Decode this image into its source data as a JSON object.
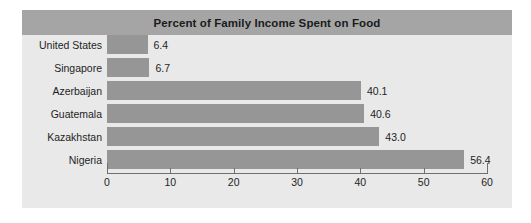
{
  "chart_data": {
    "type": "bar",
    "orientation": "horizontal",
    "title": "Percent of Family Income Spent on Food",
    "xlabel": "",
    "ylabel": "",
    "xlim": [
      0,
      60
    ],
    "xticks": [
      0,
      10,
      20,
      30,
      40,
      50,
      60
    ],
    "xtick_labels": [
      "0",
      "10",
      "20",
      "30",
      "40",
      "50",
      "60"
    ],
    "grid": false,
    "legend": "none",
    "categories": [
      "United States",
      "Singapore",
      "Azerbaijan",
      "Guatemala",
      "Kazakhstan",
      "Nigeria"
    ],
    "values": [
      6.4,
      6.7,
      40.1,
      40.6,
      43.0,
      56.4
    ],
    "value_labels": [
      "6.4",
      "6.7",
      "40.1",
      "40.6",
      "43.0",
      "56.4"
    ],
    "colors": {
      "bar_fill": "#969696",
      "plot_background": "#e9e9e9",
      "title_band": "#a5a5a5",
      "title_text": "#1b1b1b",
      "axis_line": "#6f6f6f",
      "label_text": "#1e1e1e",
      "page_background": "#ffffff"
    }
  }
}
